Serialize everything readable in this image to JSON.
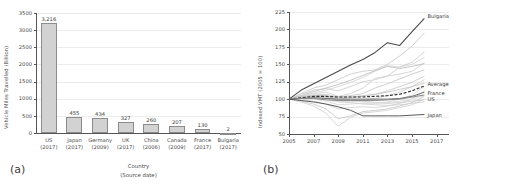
{
  "figure": {
    "panel_a_tag": "(a)",
    "panel_b_tag": "(b)"
  },
  "chart_data": [
    {
      "id": "vmt-by-country",
      "type": "bar",
      "title": "",
      "xlabel": "Country",
      "xlabel_sub": "(Source date)",
      "ylabel": "Vehicle Miles Travelled (Billion)",
      "ylim": [
        0,
        3500
      ],
      "yticks": [
        0,
        500,
        1000,
        1500,
        2000,
        2500,
        3000,
        3500
      ],
      "ytick_labels": [
        "0",
        "500",
        "1000",
        "1500",
        "2000",
        "2500",
        "3000",
        "3500"
      ],
      "grid": true,
      "legend": "none",
      "categories": [
        "US",
        "Japan",
        "Germany",
        "UK",
        "China",
        "Canada",
        "France",
        "Bulgaria"
      ],
      "category_sub": [
        "(2017)",
        "(2017)",
        "(2009)",
        "(2017)",
        "(2006)",
        "(2009)",
        "(2017)",
        "(2017)"
      ],
      "values": [
        3216,
        455,
        434,
        327,
        260,
        207,
        130,
        2
      ],
      "value_labels": [
        "3,216",
        "455",
        "434",
        "327",
        "260",
        "207",
        "130",
        "2"
      ],
      "bar_fill": "#d2d2d2",
      "bar_edge": "#8c8c8c"
    },
    {
      "id": "indexed-vmt",
      "type": "line",
      "title": "",
      "xlabel": "",
      "ylabel": "Indexed VMT (2005 = 100)",
      "xlim": [
        2005,
        2018
      ],
      "ylim": [
        50,
        225
      ],
      "yticks": [
        50,
        75,
        100,
        125,
        150,
        175,
        200,
        225
      ],
      "ytick_labels": [
        "50",
        "75",
        "100",
        "125",
        "150",
        "175",
        "200",
        "225"
      ],
      "xticks": [
        2005,
        2007,
        2009,
        2011,
        2013,
        2015,
        2017
      ],
      "xtick_labels": [
        "2005",
        "2007",
        "2009",
        "2011",
        "2013",
        "2015",
        "2017"
      ],
      "grid": true,
      "legend": "inline-right",
      "x": [
        2005,
        2006,
        2007,
        2008,
        2009,
        2010,
        2011,
        2012,
        2013,
        2014,
        2015,
        2016
      ],
      "series": [
        {
          "name": "Bulgaria",
          "labelled": true,
          "color": "#4a4a4a",
          "width": 1.1,
          "values": [
            100,
            113,
            122,
            131,
            140,
            149,
            157,
            167,
            181,
            177,
            197,
            216
          ]
        },
        {
          "name": "Average",
          "labelled": true,
          "color": "#2a2a2a",
          "width": 1.1,
          "dashed": true,
          "values": [
            100,
            102,
            104,
            104,
            103,
            103,
            103,
            104,
            105,
            107,
            112,
            119
          ]
        },
        {
          "name": "France",
          "labelled": true,
          "color": "#6e6e6e",
          "width": 1.0,
          "values": [
            100,
            101,
            102,
            101,
            100,
            100,
            100,
            100,
            100,
            101,
            104,
            110
          ]
        },
        {
          "name": "US",
          "labelled": true,
          "color": "#8a8a8a",
          "width": 1.0,
          "values": [
            100,
            101,
            101,
            99,
            98,
            98,
            98,
            98,
            99,
            100,
            103,
            106
          ]
        },
        {
          "name": "Japan",
          "labelled": true,
          "color": "#5a5a5a",
          "width": 1.0,
          "values": [
            100,
            98,
            96,
            93,
            89,
            84,
            76,
            76,
            76,
            76,
            77,
            78
          ]
        },
        {
          "name": "series-g1",
          "labelled": false,
          "color": "#cccccc",
          "width": 0.9,
          "values": [
            100,
            108,
            116,
            120,
            128,
            136,
            140,
            142,
            150,
            162,
            176,
            195
          ]
        },
        {
          "name": "series-g2",
          "labelled": false,
          "color": "#cfcfcf",
          "width": 0.9,
          "values": [
            100,
            107,
            113,
            115,
            112,
            118,
            125,
            128,
            133,
            146,
            153,
            168
          ]
        },
        {
          "name": "series-g3",
          "labelled": false,
          "color": "#d2d2d2",
          "width": 0.9,
          "values": [
            100,
            104,
            108,
            110,
            104,
            108,
            116,
            130,
            133,
            136,
            140,
            152
          ]
        },
        {
          "name": "series-g4",
          "labelled": false,
          "color": "#c8c8c8",
          "width": 0.9,
          "values": [
            100,
            103,
            106,
            107,
            103,
            105,
            108,
            116,
            122,
            129,
            136,
            142
          ]
        },
        {
          "name": "series-g5",
          "labelled": false,
          "color": "#d6d6d6",
          "width": 0.9,
          "values": [
            100,
            104,
            109,
            113,
            118,
            124,
            131,
            140,
            148,
            146,
            150,
            160
          ]
        },
        {
          "name": "series-g6",
          "labelled": false,
          "color": "#cdcdcd",
          "width": 0.9,
          "values": [
            100,
            102,
            105,
            104,
            100,
            102,
            104,
            107,
            112,
            118,
            124,
            133
          ]
        },
        {
          "name": "series-g7",
          "labelled": false,
          "color": "#d0d0d0",
          "width": 0.9,
          "values": [
            100,
            101,
            103,
            102,
            98,
            98,
            99,
            101,
            105,
            110,
            118,
            128
          ]
        },
        {
          "name": "series-g8",
          "labelled": false,
          "color": "#c5c5c5",
          "width": 0.9,
          "values": [
            100,
            103,
            105,
            105,
            102,
            103,
            105,
            107,
            110,
            114,
            118,
            123
          ]
        },
        {
          "name": "series-g9",
          "labelled": false,
          "color": "#d8d8d8",
          "width": 0.9,
          "values": [
            100,
            100,
            100,
            97,
            92,
            93,
            94,
            94,
            96,
            100,
            106,
            118
          ]
        },
        {
          "name": "series-g10",
          "labelled": false,
          "color": "#d4d4d4",
          "width": 0.9,
          "values": [
            100,
            99,
            97,
            93,
            86,
            88,
            89,
            88,
            90,
            94,
            100,
            112
          ]
        },
        {
          "name": "series-g11",
          "labelled": false,
          "color": "#cacaca",
          "width": 0.9,
          "values": [
            100,
            97,
            93,
            86,
            72,
            76,
            82,
            84,
            86,
            90,
            95,
            104
          ]
        },
        {
          "name": "series-g12",
          "labelled": false,
          "color": "#d5d5d5",
          "width": 0.9,
          "values": [
            100,
            96,
            90,
            80,
            61,
            74,
            80,
            82,
            84,
            88,
            92,
            100
          ]
        },
        {
          "name": "series-g13",
          "labelled": false,
          "color": "#c9c9c9",
          "width": 0.9,
          "values": [
            100,
            102,
            104,
            103,
            99,
            99,
            97,
            95,
            94,
            95,
            97,
            99
          ]
        },
        {
          "name": "series-g14",
          "labelled": false,
          "color": "#d3d3d3",
          "width": 0.9,
          "values": [
            100,
            101,
            102,
            100,
            96,
            95,
            93,
            92,
            91,
            92,
            94,
            96
          ]
        },
        {
          "name": "series-g15",
          "labelled": false,
          "color": "#bfbfbf",
          "width": 0.9,
          "values": [
            100,
            105,
            111,
            116,
            121,
            127,
            134,
            141,
            147,
            144,
            147,
            151
          ]
        },
        {
          "name": "series-g16",
          "labelled": false,
          "color": "#dadada",
          "width": 0.9,
          "values": [
            100,
            102,
            103,
            101,
            97,
            97,
            96,
            95,
            95,
            97,
            100,
            105
          ]
        }
      ]
    }
  ]
}
